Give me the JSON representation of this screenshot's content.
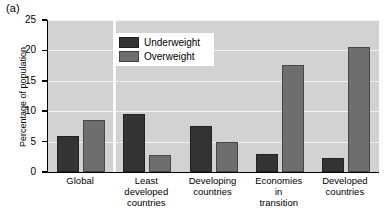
{
  "panel": {
    "label": "(a)"
  },
  "chart_data": {
    "type": "bar",
    "title": "",
    "xlabel": "",
    "ylabel": "Percentage of population",
    "ylim": [
      0,
      25
    ],
    "yticks": [
      0,
      5,
      10,
      15,
      20,
      25
    ],
    "ytick_labels": [
      "0",
      "5",
      "10",
      "15",
      "20",
      "25"
    ],
    "grid": true,
    "legend_position": "upper-left-inside",
    "categories": [
      "Global",
      "Least\ndeveloped\ncountries",
      "Developing\ncountries",
      "Economies\nin\ntransition",
      "Developed\ncountries"
    ],
    "series": [
      {
        "name": "Underweight",
        "color": "#343434",
        "values": [
          6.0,
          9.5,
          7.6,
          3.0,
          2.3
        ]
      },
      {
        "name": "Overweight",
        "color": "#6e6e6e",
        "values": [
          8.5,
          2.8,
          5.0,
          17.6,
          20.6
        ]
      }
    ]
  },
  "legend": {
    "entries": [
      {
        "label": "Underweight",
        "color": "#343434"
      },
      {
        "label": "Overweight",
        "color": "#6e6e6e"
      }
    ]
  },
  "colors": {
    "plot_background": "#d2d2d2",
    "gridline": "#f2f2f2",
    "axis": "#000000",
    "underweight": "#343434",
    "overweight": "#6e6e6e",
    "legend_background": "#ffffff"
  }
}
